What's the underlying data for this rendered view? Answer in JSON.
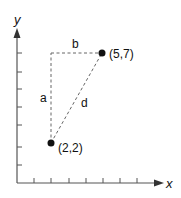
{
  "diagram": {
    "type": "coordinate-distance",
    "axes": {
      "x_label": "x",
      "y_label": "y",
      "x_ticks": [
        1,
        2,
        3,
        4,
        5,
        6,
        7
      ],
      "y_ticks": [
        1,
        2,
        3,
        4,
        5,
        6,
        7
      ]
    },
    "points": [
      {
        "label": "(2,2)",
        "x": 2,
        "y": 2
      },
      {
        "label": "(5,7)",
        "x": 5,
        "y": 7
      }
    ],
    "segments": {
      "a": "a",
      "b": "b",
      "d": "d"
    },
    "colors": {
      "ink": "#111111",
      "axis": "#555555",
      "dash": "#666666"
    }
  }
}
